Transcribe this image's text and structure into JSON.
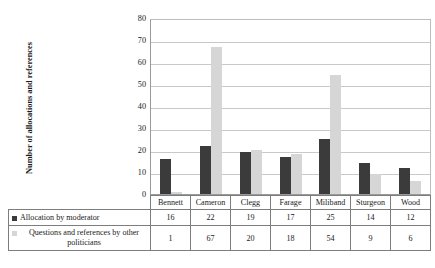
{
  "chart_data": {
    "type": "bar",
    "title": "",
    "xlabel": "",
    "ylabel": "Number of allocations and references",
    "ylim": [
      0,
      80
    ],
    "yticks": [
      0,
      10,
      20,
      30,
      40,
      50,
      60,
      70,
      80
    ],
    "grid": true,
    "legend_position": "below-table-left",
    "categories": [
      "Bennett",
      "Cameron",
      "Clegg",
      "Farage",
      "Miliband",
      "Sturgeon",
      "Wood"
    ],
    "series": [
      {
        "name": "Allocation by moderator",
        "color": "#3b3b3b",
        "values": [
          16,
          22,
          19,
          17,
          25,
          14,
          12
        ]
      },
      {
        "name": "Questions and references by other politicians",
        "color": "#d6d6d6",
        "values": [
          1,
          67,
          20,
          18,
          54,
          9,
          6
        ]
      }
    ]
  },
  "axis": {
    "y_title": "Number of allocations and references",
    "y_tick_labels": [
      "80",
      "70",
      "60",
      "50",
      "40",
      "30",
      "20",
      "10",
      "0"
    ]
  },
  "table": {
    "category_row": [
      "Bennett",
      "Cameron",
      "Clegg",
      "Farage",
      "Miliband",
      "Sturgeon",
      "Wood"
    ],
    "rows": [
      {
        "legend": "Allocation by moderator",
        "swatch": "dark-square-icon",
        "values": [
          "16",
          "22",
          "19",
          "17",
          "25",
          "14",
          "12"
        ]
      },
      {
        "legend": "Questions and references by other politicians",
        "swatch": "light-square-icon",
        "values": [
          "1",
          "67",
          "20",
          "18",
          "54",
          "9",
          "6"
        ]
      }
    ]
  }
}
